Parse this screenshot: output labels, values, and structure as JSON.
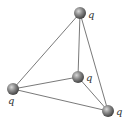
{
  "diagram": {
    "type": "tetrahedron-charges",
    "charge_label": "q",
    "colors": {
      "edge": "#6a6a6a",
      "sphere_light": "#d8d8d8",
      "sphere_mid": "#8a8a8a",
      "sphere_dark": "#3a3a3a",
      "label": "#333333"
    },
    "vertices": [
      {
        "id": "top",
        "label": "q",
        "cx": 80,
        "cy": 13,
        "r": 6,
        "lx": 88,
        "ly": 18
      },
      {
        "id": "left",
        "label": "q",
        "cx": 13,
        "cy": 89,
        "r": 6,
        "lx": 8,
        "ly": 104
      },
      {
        "id": "middle",
        "label": "q",
        "cx": 78,
        "cy": 77,
        "r": 6,
        "lx": 86,
        "ly": 81
      },
      {
        "id": "bottom-right",
        "label": "q",
        "cx": 108,
        "cy": 111,
        "r": 6,
        "lx": 116,
        "ly": 115
      }
    ],
    "edges": [
      [
        "top",
        "left"
      ],
      [
        "top",
        "middle"
      ],
      [
        "top",
        "bottom-right"
      ],
      [
        "left",
        "middle"
      ],
      [
        "left",
        "bottom-right"
      ],
      [
        "middle",
        "bottom-right"
      ]
    ]
  }
}
